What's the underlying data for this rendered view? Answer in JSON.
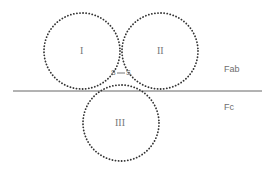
{
  "diagram": {
    "circles": [
      {
        "id": "I",
        "label": "I",
        "cx": 82,
        "cy": 51,
        "r": 38
      },
      {
        "id": "II",
        "label": "II",
        "cx": 160,
        "cy": 51,
        "r": 38
      },
      {
        "id": "III",
        "label": "III",
        "cx": 121,
        "cy": 123,
        "r": 38
      }
    ],
    "bond": {
      "label": "S—S",
      "left": "S",
      "right": "S"
    },
    "boundary_line": {
      "y": 91,
      "x1": 13,
      "x2": 262
    },
    "regions": {
      "upper": "Fab",
      "lower": "Fc"
    },
    "colors": {
      "dots": "#333333",
      "line": "#555555",
      "text": "#6e6e6e"
    }
  }
}
